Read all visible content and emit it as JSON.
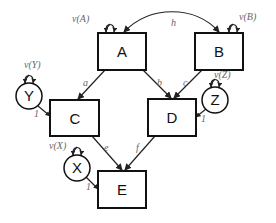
{
  "diagram": {
    "type": "path-diagram",
    "nodes": {
      "A": {
        "label": "A",
        "shape": "box"
      },
      "B": {
        "label": "B",
        "shape": "box"
      },
      "C": {
        "label": "C",
        "shape": "box"
      },
      "D": {
        "label": "D",
        "shape": "box"
      },
      "E": {
        "label": "E",
        "shape": "box"
      },
      "X": {
        "label": "X",
        "shape": "circle"
      },
      "Y": {
        "label": "Y",
        "shape": "circle"
      },
      "Z": {
        "label": "Z",
        "shape": "circle"
      }
    },
    "variance_labels": {
      "A": "v(A)",
      "B": "v(B)",
      "X": "v(X)",
      "Y": "v(Y)",
      "Z": "v(Z)"
    },
    "edges": [
      {
        "from": "A",
        "to": "C",
        "label": "a"
      },
      {
        "from": "A",
        "to": "D",
        "label": "b"
      },
      {
        "from": "B",
        "to": "D",
        "label": "c"
      },
      {
        "from": "C",
        "to": "E",
        "label": "e"
      },
      {
        "from": "D",
        "to": "E",
        "label": "f"
      },
      {
        "from": "Y",
        "to": "C",
        "label": "1"
      },
      {
        "from": "Z",
        "to": "D",
        "label": "1"
      },
      {
        "from": "X",
        "to": "E",
        "label": "1"
      }
    ],
    "covariances": [
      {
        "between": [
          "A",
          "B"
        ],
        "label": "h"
      }
    ]
  }
}
